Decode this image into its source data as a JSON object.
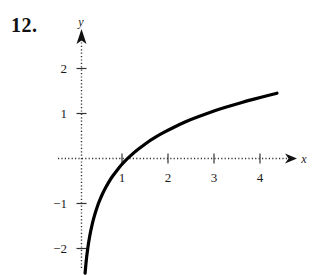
{
  "problem": {
    "number": "12."
  },
  "chart_data": {
    "type": "line",
    "title": "",
    "subtitle": "",
    "function": "y = ln(x)",
    "xlabel": "x",
    "ylabel": "y",
    "xlim": [
      -0.5,
      4.6
    ],
    "ylim": [
      -2.55,
      2.6
    ],
    "xticks": [
      1,
      2,
      3,
      4
    ],
    "yticks": [
      2,
      1,
      -1,
      -2
    ],
    "xtick_labels": [
      "1",
      "2",
      "3",
      "4"
    ],
    "ytick_labels": [
      "2",
      "1",
      "−1",
      "−2"
    ],
    "grid": false,
    "axis_style": "dotted",
    "legend": null,
    "annotations": [],
    "curve_color": "#000000",
    "axis_color": "#333333",
    "x": [
      0.078,
      0.09,
      0.105,
      0.12,
      0.14,
      0.16,
      0.185,
      0.21,
      0.24,
      0.275,
      0.32,
      0.37,
      0.42,
      0.48,
      0.55,
      0.63,
      0.72,
      0.82,
      0.92,
      1.0,
      1.15,
      1.3,
      1.5,
      1.7,
      1.9,
      2.1,
      2.4,
      2.7,
      3.0,
      3.3,
      3.6,
      3.9,
      4.25
    ],
    "y": [
      -2.55,
      -2.41,
      -2.25,
      -2.12,
      -1.97,
      -1.83,
      -1.69,
      -1.56,
      -1.43,
      -1.29,
      -1.14,
      -0.99,
      -0.87,
      -0.73,
      -0.6,
      -0.46,
      -0.33,
      -0.2,
      -0.08,
      0.0,
      0.14,
      0.26,
      0.41,
      0.53,
      0.64,
      0.74,
      0.88,
      0.99,
      1.1,
      1.19,
      1.28,
      1.36,
      1.45
    ]
  },
  "icons": {
    "x_axis_arrow": "arrow-right-icon",
    "y_axis_arrow": "arrow-up-icon"
  }
}
